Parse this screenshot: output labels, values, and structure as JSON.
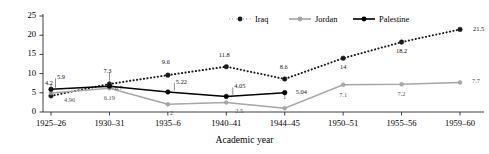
{
  "chart_data": {
    "type": "line",
    "title": "",
    "xlabel": "Academic year",
    "ylabel": "",
    "ylim": [
      0,
      25
    ],
    "yticks": [
      0,
      5,
      10,
      15,
      20,
      25
    ],
    "grid": false,
    "legend_position": "top-right",
    "categories": [
      "1925–26",
      "1930–31",
      "1935–6",
      "1940–41",
      "1944–45",
      "1950–51",
      "1955–56",
      "1959–60"
    ],
    "series": [
      {
        "name": "Iraq",
        "color": "#1a1a1a",
        "style": "dotted",
        "marker": "circle-filled",
        "values": [
          4.2,
          7.3,
          9.6,
          11.8,
          8.6,
          14,
          18.2,
          21.5
        ],
        "labels": [
          "4.2",
          "7.3",
          "9.6",
          "11.8",
          "8.6",
          "14",
          "18.2",
          "21.5"
        ]
      },
      {
        "name": "Jordan",
        "color": "#a6a6a6",
        "style": "solid",
        "marker": "circle-filled",
        "values": [
          4.96,
          6.19,
          2,
          2.5,
          1,
          7.1,
          7.2,
          7.7
        ],
        "labels": [
          "4.96",
          "6.19",
          "2",
          "2.5",
          "1",
          "7.1",
          "7.2",
          "7.7"
        ]
      },
      {
        "name": "Palestine",
        "color": "#000000",
        "style": "solid",
        "marker": "circle-filled",
        "values": [
          5.9,
          6.7,
          5.22,
          4.05,
          5.04,
          null,
          null,
          null
        ],
        "labels": [
          "5.9",
          "6.7",
          "5.22",
          "4.05",
          "5.04",
          "",
          "",
          ""
        ]
      }
    ]
  },
  "legend": {
    "items": [
      {
        "label": "Iraq"
      },
      {
        "label": "Jordan"
      },
      {
        "label": "Palestine"
      }
    ]
  },
  "axis": {
    "x_title": "Academic year"
  }
}
